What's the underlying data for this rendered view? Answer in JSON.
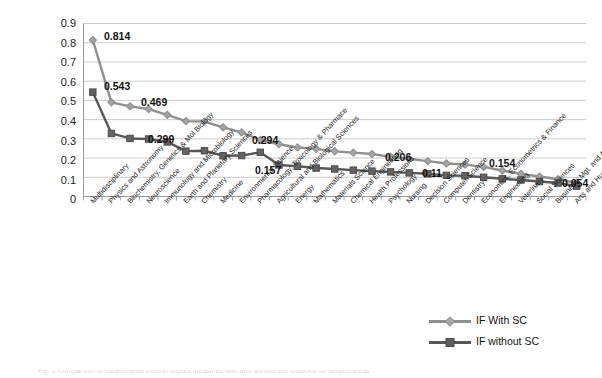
{
  "chart_data": {
    "type": "line",
    "title": "",
    "subtitle": "",
    "xlabel": "",
    "ylabel": "",
    "ylim": [
      0,
      0.9
    ],
    "ytick_labels": [
      "0.9",
      "0.8",
      "0.7",
      "0.6",
      "0.5",
      "0.4",
      "0.3",
      "0.2",
      "0.1",
      "0"
    ],
    "ytick_values": [
      0.9,
      0.8,
      0.7,
      0.6,
      0.5,
      0.4,
      0.3,
      0.2,
      0.1,
      0
    ],
    "grid": true,
    "legend_position": "bottom-right",
    "categories": [
      "Multidisciplinary",
      "Physics and Astronomy",
      "Biochemistry, Genetics & Mol Biology",
      "Neuroscience",
      "Immunology and Microbiology",
      "Earth and Planetary Sciences",
      "Chemistry",
      "Medicine",
      "Environmental Science",
      "Pharmacology, Toxicology & Pharmace",
      "Agricultural and Biological Sciences",
      "Energy",
      "Mathematics",
      "Materials Science",
      "Chemical Engineering",
      "Health Professions",
      "Psychology",
      "Nursing",
      "Decision Sciences",
      "Computer Science",
      "Dentistry",
      "Economics, Econometrics & Finance",
      "Engineering",
      "Veterinary",
      "Social Sciences",
      "Business, Mgt. and Accounting",
      "Arts and Humanities"
    ],
    "series": [
      {
        "name": "IF With SC",
        "color": "#8f8f8f",
        "marker": "diamond",
        "values": [
          0.814,
          0.49,
          0.469,
          0.455,
          0.425,
          0.392,
          0.39,
          0.36,
          0.333,
          0.294,
          0.272,
          0.255,
          0.248,
          0.235,
          0.228,
          0.221,
          0.206,
          0.196,
          0.184,
          0.172,
          0.166,
          0.154,
          0.135,
          0.118,
          0.104,
          0.09,
          0.07
        ]
      },
      {
        "name": "IF without SC",
        "color": "#575757",
        "marker": "square",
        "values": [
          0.543,
          0.328,
          0.302,
          0.299,
          0.284,
          0.236,
          0.238,
          0.212,
          0.213,
          0.23,
          0.164,
          0.157,
          0.148,
          0.143,
          0.137,
          0.132,
          0.128,
          0.123,
          0.118,
          0.11,
          0.108,
          0.1,
          0.092,
          0.086,
          0.078,
          0.07,
          0.054
        ]
      }
    ],
    "annotations": [
      {
        "text": "0.814",
        "series": "IF With SC",
        "category_index": 0,
        "value": 0.814
      },
      {
        "text": "0.543",
        "series": "IF without SC",
        "category_index": 0,
        "value": 0.543
      },
      {
        "text": "0.469",
        "series": "IF With SC",
        "category_index": 2,
        "value": 0.469
      },
      {
        "text": "0.299",
        "series": "IF without SC",
        "category_index": 3,
        "value": 0.299
      },
      {
        "text": "0.294",
        "series": "IF With SC",
        "category_index": 9,
        "value": 0.294
      },
      {
        "text": "0.157",
        "series": "IF without SC",
        "category_index": 11,
        "value": 0.157
      },
      {
        "text": "0.206",
        "series": "IF With SC",
        "category_index": 16,
        "value": 0.206
      },
      {
        "text": "0.11",
        "series": "IF without SC",
        "category_index": 19,
        "value": 0.11
      },
      {
        "text": "0.154",
        "series": "IF With SC",
        "category_index": 21,
        "value": 0.154
      },
      {
        "text": "0.054",
        "series": "IF without SC",
        "category_index": 26,
        "value": 0.054
      }
    ]
  },
  "axis": {
    "y": {
      "t0": "0.9",
      "t1": "0.8",
      "t2": "0.7",
      "t3": "0.6",
      "t4": "0.5",
      "t5": "0.4",
      "t6": "0.3",
      "t7": "0.2",
      "t8": "0.1",
      "t9": "0"
    }
  },
  "x_labels": {
    "c0": "Multidisciplinary",
    "c1": "Physics and Astronomy",
    "c2": "Biochemistry, Genetics & Mol Biology",
    "c3": "Neuroscience",
    "c4": "Immunology and Microbiology",
    "c5": "Earth and Planetary Sciences",
    "c6": "Chemistry",
    "c7": "Medicine",
    "c8": "Environmental Science",
    "c9": "Pharmacology, Toxicology & Pharmace",
    "c10": "Agricultural and Biological Sciences",
    "c11": "Energy",
    "c12": "Mathematics",
    "c13": "Materials Science",
    "c14": "Chemical Engineering",
    "c15": "Health Professions",
    "c16": "Psychology",
    "c17": "Nursing",
    "c18": "Decision Sciences",
    "c19": "Computer Science",
    "c20": "Dentistry",
    "c21": "Economics, Econometrics & Finance",
    "c22": "Engineering",
    "c23": "Veterinary",
    "c24": "Social Sciences",
    "c25": "Business, Mgt. and Accounting",
    "c26": "Arts and Humanities"
  },
  "data_labels": {
    "d0": "0.814",
    "d1": "0.543",
    "d2": "0.469",
    "d3": "0.299",
    "d4": "0.294",
    "d5": "0.157",
    "d6": "0.206",
    "d7": "0.11",
    "d8": "0.154",
    "d9": "0.054"
  },
  "legend": {
    "item0": "IF With SC",
    "item1": "IF without SC"
  },
  "caption": {
    "text": "Fig. 1 Comparison of subject-level citation impact measures with and without self-citations for subject areas"
  },
  "colors": {
    "series_with_sc": "#8f8f8f",
    "series_without_sc": "#575757",
    "grid": "#bfbfbf",
    "axis": "#9a9a9a",
    "text": "#1c1c1c"
  }
}
